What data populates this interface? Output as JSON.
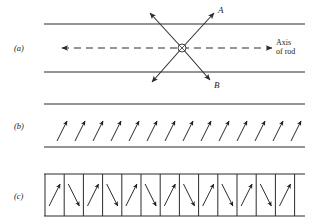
{
  "figure": {
    "background_color": "#ffffff",
    "ink_color": "#2b2b2b"
  },
  "panels": [
    {
      "id": "a",
      "label": "(a)",
      "description": "Rod with axis and two crossing rays A and B",
      "rod": {
        "top_line": {
          "x1": 44,
          "y1": 24,
          "x2": 305,
          "y2": 24
        },
        "bottom_line": {
          "x1": 44,
          "y1": 72,
          "x2": 305,
          "y2": 72
        }
      },
      "axis": {
        "label_line_1": "Axis",
        "label_line_2": "of rod",
        "dashed_line": {
          "x1": 62,
          "y1": 48,
          "x2": 272,
          "y2": 48
        },
        "left_arrow": true,
        "right_arrow": true
      },
      "node": {
        "cx": 182,
        "cy": 48,
        "r": 4.0,
        "style": "crossed-circle"
      },
      "rays": [
        {
          "name": "A",
          "label": "A",
          "from": [
            182,
            48
          ],
          "to": [
            214,
            13
          ],
          "arrowhead": true,
          "label_pos": [
            218,
            10
          ]
        },
        {
          "name": "B",
          "label": "B",
          "from": [
            182,
            48
          ],
          "to": [
            210,
            80
          ],
          "arrowhead": true,
          "label_pos": [
            214,
            85
          ]
        },
        {
          "name": "upper-left",
          "label": "",
          "from": [
            182,
            48
          ],
          "to": [
            150,
            13
          ],
          "arrowhead": true,
          "label_pos": null
        },
        {
          "name": "lower-left",
          "label": "",
          "from": [
            182,
            48
          ],
          "to": [
            152,
            82
          ],
          "arrowhead": true,
          "label_pos": null
        }
      ]
    },
    {
      "id": "b",
      "label": "(b)",
      "description": "Rod interior filled with uniformly tilted domain arrows",
      "rod": {
        "top_line": {
          "x1": 44,
          "y1": 104,
          "x2": 305,
          "y2": 104
        },
        "bottom_line": {
          "x1": 44,
          "y1": 147,
          "x2": 305,
          "y2": 147
        }
      },
      "arrow_count": 14,
      "arrow_first_x": 57,
      "arrow_spacing": 18,
      "arrow_base_y": 141,
      "arrow_dx": 10,
      "arrow_dy": -20,
      "arrow_angle_deg": 63
    },
    {
      "id": "c",
      "label": "(c)",
      "description": "Rod divided into domain cells with alternating arrow directions",
      "rod": {
        "top_line": {
          "x1": 44,
          "y1": 174,
          "x2": 305,
          "y2": 174
        },
        "bottom_line": {
          "x1": 44,
          "y1": 216,
          "x2": 305,
          "y2": 216
        }
      },
      "cell_count": 13,
      "cell_first_x": 45,
      "cell_width": 19.2,
      "cell_top_y": 174,
      "cell_bottom_y": 216,
      "arrow_pattern": [
        "up-right",
        "down-right"
      ],
      "arrow_dx": 11,
      "arrow_dy": 22
    }
  ]
}
